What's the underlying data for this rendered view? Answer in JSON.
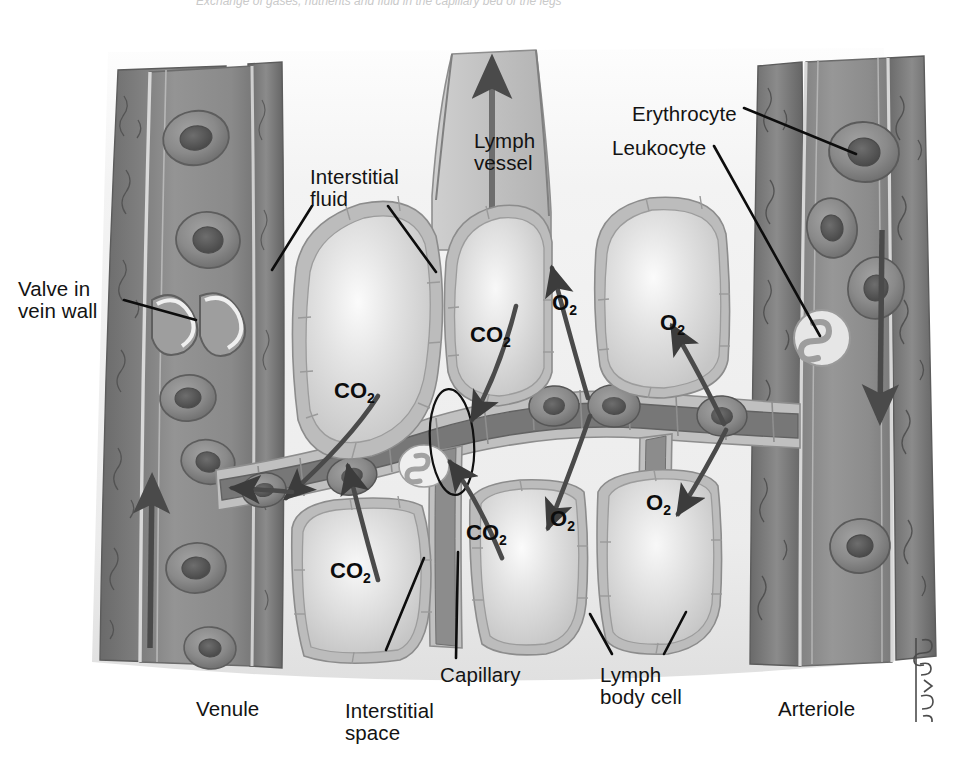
{
  "figure": {
    "title": "Exchange of gases, nutrients and fluid in the capillary bed of the legs",
    "artist_signature": "BMcKell"
  },
  "labels": [
    {
      "id": "valve-in-vein-wall",
      "text": "Valve in\nvein wall",
      "x": 18,
      "y": 278
    },
    {
      "id": "interstitial-fluid",
      "text": "Interstitial\nfluid",
      "x": 310,
      "y": 166
    },
    {
      "id": "lymph-vessel",
      "text": "Lymph\nvessel",
      "x": 474,
      "y": 130
    },
    {
      "id": "erythrocyte",
      "text": "Erythrocyte",
      "x": 632,
      "y": 103
    },
    {
      "id": "leukocyte",
      "text": "Leukocyte",
      "x": 612,
      "y": 137
    },
    {
      "id": "venule",
      "text": "Venule",
      "x": 196,
      "y": 698
    },
    {
      "id": "interstitial-space",
      "text": "Interstitial\nspace",
      "x": 345,
      "y": 700
    },
    {
      "id": "capillary",
      "text": "Capillary",
      "x": 440,
      "y": 664
    },
    {
      "id": "lymph-body-cell",
      "text": "Lymph\nbody cell",
      "x": 600,
      "y": 664
    },
    {
      "id": "arteriole",
      "text": "Arteriole",
      "x": 778,
      "y": 698
    }
  ],
  "gas_labels": [
    {
      "id": "co2-upper-left",
      "gas": "CO",
      "sub": "2",
      "x": 334,
      "y": 378
    },
    {
      "id": "co2-upper-mid",
      "gas": "CO",
      "sub": "2",
      "x": 470,
      "y": 322
    },
    {
      "id": "co2-lower-left",
      "gas": "CO",
      "sub": "2",
      "x": 330,
      "y": 558
    },
    {
      "id": "co2-lower-mid",
      "gas": "CO",
      "sub": "2",
      "x": 466,
      "y": 520
    },
    {
      "id": "o2-upper-left",
      "gas": "O",
      "sub": "2",
      "x": 552,
      "y": 290
    },
    {
      "id": "o2-upper-right",
      "gas": "O",
      "sub": "2",
      "x": 660,
      "y": 310
    },
    {
      "id": "o2-lower-left",
      "gas": "O",
      "sub": "2",
      "x": 550,
      "y": 506
    },
    {
      "id": "o2-lower-right",
      "gas": "O",
      "sub": "2",
      "x": 646,
      "y": 490
    }
  ],
  "colors": {
    "background": "#ffffff",
    "interstitial_fluid": "#f2f2f2",
    "vessel_lumen": "#8f8f8f",
    "vessel_lumen_dark": "#757575",
    "vessel_wall": "#b5b5b5",
    "vessel_wall_outer": "#6e6e6e",
    "cell_cytoplasm": "#d2d2d2",
    "cell_membrane": "#9b9b9b",
    "erythrocyte_body": "#8a8a8a",
    "erythrocyte_nucleus": "#606060",
    "leukocyte_body": "#e3e3e3",
    "arrow": "#3a3a3a",
    "leader_line": "#0d0d0d",
    "text": "#131313"
  },
  "vessels": {
    "venule": {
      "name": "Venule",
      "side": "left",
      "flow_direction": "up"
    },
    "arteriole": {
      "name": "Arteriole",
      "side": "right",
      "flow_direction": "down"
    },
    "lymph_vessel": {
      "name": "Lymph vessel",
      "position": "top-center",
      "flow_direction": "up"
    },
    "capillary": {
      "name": "Capillary",
      "position": "center",
      "flow_direction": "right-to-left"
    }
  },
  "cells": {
    "body_cells_count": 6,
    "erythrocytes_in_venule": 6,
    "erythrocytes_in_arteriole": 4,
    "erythrocytes_in_capillary": 5,
    "leukocytes": 2
  }
}
